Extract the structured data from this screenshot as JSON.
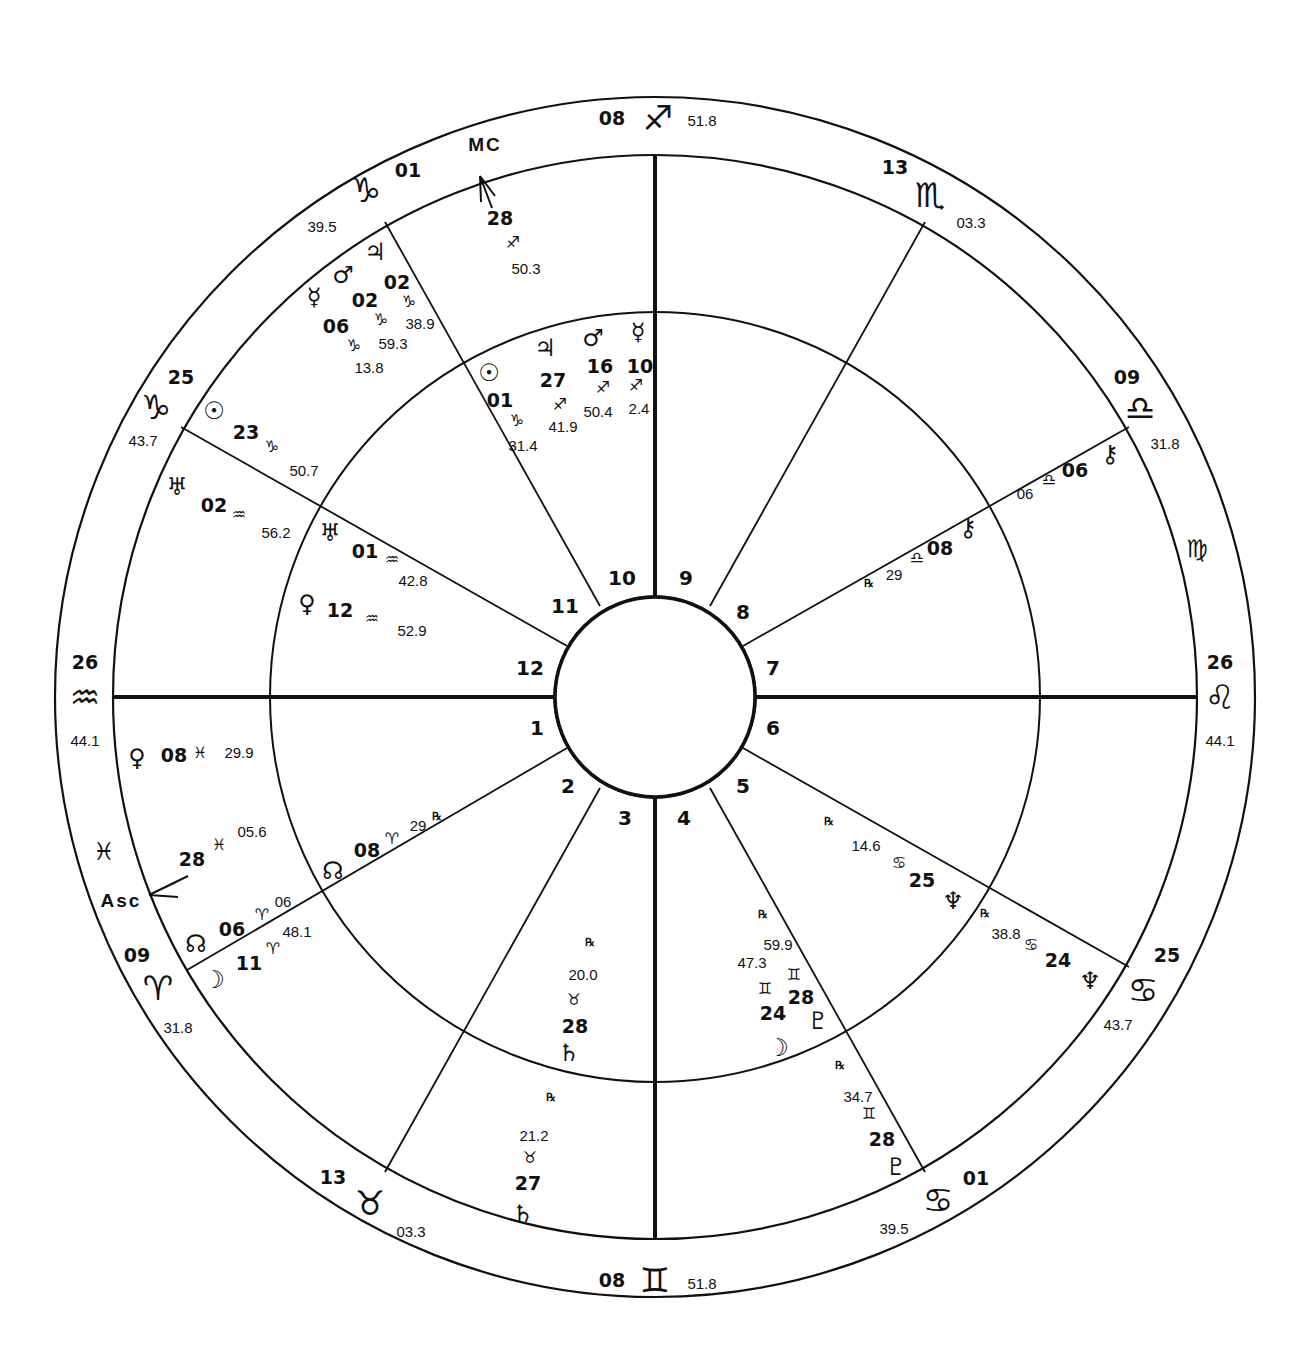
{
  "chart": {
    "type": "bi-wheel natal chart",
    "center": [
      655,
      697
    ],
    "radii": {
      "outer": 600,
      "zodiac_inner": 542,
      "middle": 385,
      "hub": 100
    },
    "line_color": "#111111",
    "background": "#ffffff"
  },
  "cusp_lines": [
    {
      "house": 10,
      "x1": 655,
      "y1": 597,
      "x2": 655,
      "y2": 155,
      "heavy": true
    },
    {
      "house": 4,
      "x1": 655,
      "y1": 797,
      "x2": 655,
      "y2": 1239,
      "heavy": true
    },
    {
      "house": 1,
      "x1": 555,
      "y1": 697,
      "x2": 113,
      "y2": 697,
      "heavy": true
    },
    {
      "house": 7,
      "x1": 755,
      "y1": 697,
      "x2": 1197,
      "y2": 697,
      "heavy": true
    },
    {
      "house": 11,
      "x1": 600,
      "y1": 606,
      "x2": 385,
      "y2": 222,
      "heavy": false
    },
    {
      "house": 12,
      "x1": 567,
      "y1": 646,
      "x2": 181,
      "y2": 427,
      "heavy": false
    },
    {
      "house": 2,
      "x1": 567,
      "y1": 748,
      "x2": 187,
      "y2": 970,
      "heavy": false
    },
    {
      "house": 3,
      "x1": 600,
      "y1": 788,
      "x2": 385,
      "y2": 1172,
      "heavy": false
    },
    {
      "house": 5,
      "x1": 710,
      "y1": 788,
      "x2": 925,
      "y2": 1172,
      "heavy": false
    },
    {
      "house": 6,
      "x1": 743,
      "y1": 748,
      "x2": 1129,
      "y2": 967,
      "heavy": false
    },
    {
      "house": 8,
      "x1": 743,
      "y1": 646,
      "x2": 1129,
      "y2": 427,
      "heavy": false
    },
    {
      "house": 9,
      "x1": 710,
      "y1": 606,
      "x2": 925,
      "y2": 222,
      "heavy": false
    }
  ],
  "house_numbers": [
    {
      "n": "10",
      "x": 622,
      "y": 578
    },
    {
      "n": "9",
      "x": 686,
      "y": 578
    },
    {
      "n": "8",
      "x": 743,
      "y": 612
    },
    {
      "n": "7",
      "x": 773,
      "y": 668
    },
    {
      "n": "6",
      "x": 773,
      "y": 728
    },
    {
      "n": "5",
      "x": 743,
      "y": 786
    },
    {
      "n": "4",
      "x": 684,
      "y": 818
    },
    {
      "n": "3",
      "x": 625,
      "y": 818
    },
    {
      "n": "2",
      "x": 568,
      "y": 786
    },
    {
      "n": "1",
      "x": 537,
      "y": 728
    },
    {
      "n": "12",
      "x": 530,
      "y": 668
    },
    {
      "n": "11",
      "x": 565,
      "y": 606
    }
  ],
  "cusp_signs": [
    {
      "id": "mc",
      "deg": "08",
      "sign": "♐",
      "sign_name": "sagittarius",
      "min": "51.8",
      "deg_pos": [
        612,
        118
      ],
      "sign_pos": [
        658,
        118
      ],
      "min_pos": [
        702,
        120
      ]
    },
    {
      "id": "c11",
      "deg": "01",
      "sign": "♑",
      "sign_name": "capricorn",
      "min": "39.5",
      "deg_pos": [
        408,
        170
      ],
      "sign_pos": [
        366,
        190
      ],
      "min_pos": [
        322,
        226
      ]
    },
    {
      "id": "c12",
      "deg": "25",
      "sign": "♑",
      "sign_name": "capricorn",
      "min": "43.7",
      "deg_pos": [
        181,
        377
      ],
      "sign_pos": [
        156,
        407
      ],
      "min_pos": [
        143,
        440
      ]
    },
    {
      "id": "asc",
      "deg": "26",
      "sign": "♒",
      "sign_name": "aquarius",
      "min": "44.1",
      "deg_pos": [
        85,
        662
      ],
      "sign_pos": [
        85,
        697
      ],
      "min_pos": [
        85,
        740
      ]
    },
    {
      "id": "c2",
      "deg": "09",
      "sign": "♈",
      "sign_name": "aries",
      "min": "31.8",
      "deg_pos": [
        137,
        955
      ],
      "sign_pos": [
        158,
        988
      ],
      "min_pos": [
        178,
        1027
      ]
    },
    {
      "id": "c3",
      "deg": "13",
      "sign": "♉",
      "sign_name": "taurus",
      "min": "03.3",
      "deg_pos": [
        333,
        1177
      ],
      "sign_pos": [
        370,
        1203
      ],
      "min_pos": [
        411,
        1231
      ]
    },
    {
      "id": "ic",
      "deg": "08",
      "sign": "♊",
      "sign_name": "gemini",
      "min": "51.8",
      "deg_pos": [
        612,
        1280
      ],
      "sign_pos": [
        655,
        1280
      ],
      "min_pos": [
        702,
        1283
      ]
    },
    {
      "id": "c5",
      "deg": "01",
      "sign": "♋",
      "sign_name": "cancer",
      "min": "39.5",
      "deg_pos": [
        976,
        1178
      ],
      "sign_pos": [
        938,
        1200
      ],
      "min_pos": [
        894,
        1228
      ]
    },
    {
      "id": "c6",
      "deg": "25",
      "sign": "♋",
      "sign_name": "cancer",
      "min": "43.7",
      "deg_pos": [
        1167,
        955
      ],
      "sign_pos": [
        1143,
        990
      ],
      "min_pos": [
        1118,
        1024
      ]
    },
    {
      "id": "dsc",
      "deg": "26",
      "sign": "♌",
      "sign_name": "leo",
      "min": "44.1",
      "deg_pos": [
        1220,
        662
      ],
      "sign_pos": [
        1220,
        697
      ],
      "min_pos": [
        1220,
        740
      ]
    },
    {
      "id": "c8",
      "deg": "09",
      "sign": "♎",
      "sign_name": "libra",
      "min": "31.8",
      "deg_pos": [
        1127,
        377
      ],
      "sign_pos": [
        1140,
        408
      ],
      "min_pos": [
        1165,
        443
      ]
    },
    {
      "id": "c9",
      "deg": "13",
      "sign": "♏",
      "sign_name": "scorpio",
      "min": "03.3",
      "deg_pos": [
        895,
        167
      ],
      "sign_pos": [
        930,
        195
      ],
      "min_pos": [
        971,
        222
      ]
    }
  ],
  "intercepted_signs": [
    {
      "sign": "♓",
      "sign_name": "pisces",
      "x": 104,
      "y": 852
    },
    {
      "sign": "♍",
      "sign_name": "virgo",
      "x": 1197,
      "y": 549
    }
  ],
  "angle_labels": [
    {
      "text": "MC",
      "x": 485,
      "y": 144
    },
    {
      "text": "Asc",
      "x": 121,
      "y": 900
    }
  ],
  "angle_arrows": [
    {
      "id": "mc-arrow",
      "path": "M480 176 L492 208 M480 176 L481 202 M480 176 L495 196"
    },
    {
      "id": "asc-arrow",
      "path": "M149 895 L188 876 M149 895 L178 897 M149 895 L176 882"
    }
  ],
  "inner_planets": [
    {
      "name": "sun",
      "glyph": "☉",
      "deg": "01",
      "sign": "♑",
      "min": "31.4",
      "glyph_pos": [
        489,
        373
      ],
      "deg_pos": [
        500,
        400
      ],
      "sign_pos": [
        517,
        421
      ],
      "min_pos": [
        523,
        445
      ]
    },
    {
      "name": "jupiter",
      "glyph": "♃",
      "deg": "27",
      "sign": "♐",
      "min": "41.9",
      "glyph_pos": [
        545,
        348
      ],
      "deg_pos": [
        553,
        380
      ],
      "sign_pos": [
        560,
        405
      ],
      "min_pos": [
        563,
        426
      ]
    },
    {
      "name": "mars",
      "glyph": "♂",
      "deg": "16",
      "sign": "♐",
      "min": "50.4",
      "glyph_pos": [
        593,
        338
      ],
      "deg_pos": [
        600,
        366
      ],
      "sign_pos": [
        603,
        388
      ],
      "min_pos": [
        598,
        411
      ]
    },
    {
      "name": "mercury",
      "glyph": "☿",
      "deg": "10",
      "sign": "♐",
      "min": "2.4",
      "glyph_pos": [
        638,
        332
      ],
      "deg_pos": [
        640,
        366
      ],
      "sign_pos": [
        636,
        386
      ],
      "min_pos": [
        639,
        408
      ]
    },
    {
      "name": "uranus",
      "glyph": "♅",
      "deg": "01",
      "sign": "♒",
      "min": "42.8",
      "glyph_pos": [
        330,
        533
      ],
      "deg_pos": [
        365,
        551
      ],
      "sign_pos": [
        392,
        560
      ],
      "min_pos": [
        413,
        580
      ]
    },
    {
      "name": "venus",
      "glyph": "♀",
      "deg": "12",
      "sign": "♒",
      "min": "52.9",
      "glyph_pos": [
        307,
        604
      ],
      "deg_pos": [
        340,
        610
      ],
      "sign_pos": [
        372,
        619
      ],
      "min_pos": [
        412,
        630
      ]
    },
    {
      "name": "north-node",
      "glyph": "☊",
      "deg": "08",
      "sign": "♈",
      "min": "29",
      "rx": "℞",
      "glyph_pos": [
        333,
        871
      ],
      "deg_pos": [
        367,
        850
      ],
      "sign_pos": [
        392,
        839
      ],
      "min_pos": [
        418,
        825
      ],
      "rx_pos": [
        437,
        816
      ]
    },
    {
      "name": "saturn",
      "glyph": "♄",
      "deg": "28",
      "sign": "♉",
      "min": "20.0",
      "rx": "℞",
      "glyph_pos": [
        569,
        1053
      ],
      "deg_pos": [
        575,
        1026
      ],
      "sign_pos": [
        574,
        1000
      ],
      "min_pos": [
        583,
        974
      ],
      "rx_pos": [
        590,
        942
      ]
    },
    {
      "name": "moon",
      "glyph": "☽",
      "deg": "24",
      "sign": "♊",
      "min": "47.3",
      "glyph_pos": [
        778,
        1048
      ],
      "deg_pos": [
        773,
        1013
      ],
      "sign_pos": [
        765,
        989
      ],
      "min_pos": [
        752,
        962
      ]
    },
    {
      "name": "pluto",
      "glyph": "♇",
      "deg": "28",
      "sign": "♊",
      "min": "59.9",
      "rx": "℞",
      "glyph_pos": [
        818,
        1021
      ],
      "deg_pos": [
        801,
        997
      ],
      "sign_pos": [
        794,
        975
      ],
      "min_pos": [
        778,
        944
      ],
      "rx_pos": [
        763,
        914
      ]
    },
    {
      "name": "neptune",
      "glyph": "♆",
      "deg": "25",
      "sign": "♋",
      "min": "14.6",
      "rx": "℞",
      "glyph_pos": [
        953,
        901
      ],
      "deg_pos": [
        922,
        880
      ],
      "sign_pos": [
        899,
        863
      ],
      "min_pos": [
        866,
        845
      ],
      "rx_pos": [
        829,
        821
      ]
    },
    {
      "name": "chiron",
      "glyph": "⚷",
      "deg": "08",
      "sign": "♎",
      "min": "29",
      "rx": "℞",
      "glyph_pos": [
        968,
        528
      ],
      "deg_pos": [
        940,
        548
      ],
      "sign_pos": [
        917,
        558
      ],
      "min_pos": [
        894,
        574
      ],
      "rx_pos": [
        869,
        583
      ]
    }
  ],
  "outer_planets": [
    {
      "name": "mc-point",
      "glyph": "",
      "deg": "28",
      "sign": "♐",
      "min": "50.3",
      "deg_pos": [
        500,
        218
      ],
      "sign_pos": [
        513,
        243
      ],
      "min_pos": [
        526,
        268
      ]
    },
    {
      "name": "jupiter",
      "glyph": "♃",
      "deg": "02",
      "sign": "♑",
      "min": "38.9",
      "glyph_pos": [
        375,
        252
      ],
      "deg_pos": [
        397,
        282
      ],
      "sign_pos": [
        409,
        302
      ],
      "min_pos": [
        420,
        323
      ]
    },
    {
      "name": "mars",
      "glyph": "♂",
      "deg": "02",
      "sign": "♑",
      "min": "59.3",
      "glyph_pos": [
        343,
        275
      ],
      "deg_pos": [
        365,
        300
      ],
      "sign_pos": [
        381,
        320
      ],
      "min_pos": [
        393,
        343
      ]
    },
    {
      "name": "mercury",
      "glyph": "☿",
      "deg": "06",
      "sign": "♑",
      "min": "13.8",
      "glyph_pos": [
        314,
        297
      ],
      "deg_pos": [
        336,
        326
      ],
      "sign_pos": [
        354,
        346
      ],
      "min_pos": [
        369,
        367
      ]
    },
    {
      "name": "sun",
      "glyph": "☉",
      "deg": "23",
      "sign": "♑",
      "min": "50.7",
      "glyph_pos": [
        214,
        411
      ],
      "deg_pos": [
        246,
        432
      ],
      "sign_pos": [
        272,
        447
      ],
      "min_pos": [
        304,
        470
      ]
    },
    {
      "name": "uranus",
      "glyph": "♅",
      "deg": "02",
      "sign": "♒",
      "min": "56.2",
      "glyph_pos": [
        177,
        487
      ],
      "deg_pos": [
        214,
        505
      ],
      "sign_pos": [
        239,
        515
      ],
      "min_pos": [
        276,
        532
      ]
    },
    {
      "name": "venus",
      "glyph": "♀",
      "deg": "08",
      "sign": "♓",
      "min": "29.9",
      "glyph_pos": [
        137,
        758
      ],
      "deg_pos": [
        174,
        755
      ],
      "sign_pos": [
        200,
        753
      ],
      "min_pos": [
        239,
        752
      ]
    },
    {
      "name": "asc-point",
      "glyph": "",
      "deg": "28",
      "sign": "♓",
      "min": "05.6",
      "deg_pos": [
        192,
        859
      ],
      "sign_pos": [
        219,
        845
      ],
      "min_pos": [
        252,
        831
      ]
    },
    {
      "name": "north-node",
      "glyph": "☊",
      "deg": "06",
      "sign": "♈",
      "min": "06",
      "glyph_pos": [
        196,
        944
      ],
      "deg_pos": [
        232,
        929
      ],
      "sign_pos": [
        262,
        915
      ],
      "min_pos": [
        283,
        901
      ]
    },
    {
      "name": "moon",
      "glyph": "☽",
      "deg": "11",
      "sign": "♈",
      "min": "48.1",
      "glyph_pos": [
        214,
        980
      ],
      "deg_pos": [
        249,
        963
      ],
      "sign_pos": [
        273,
        949
      ],
      "min_pos": [
        297,
        931
      ]
    },
    {
      "name": "saturn",
      "glyph": "♄",
      "deg": "27",
      "sign": "♉",
      "min": "21.2",
      "rx": "℞",
      "glyph_pos": [
        523,
        1214
      ],
      "deg_pos": [
        528,
        1183
      ],
      "sign_pos": [
        530,
        1158
      ],
      "min_pos": [
        534,
        1135
      ],
      "rx_pos": [
        551,
        1097
      ]
    },
    {
      "name": "pluto",
      "glyph": "♇",
      "deg": "28",
      "sign": "♊",
      "min": "34.7",
      "rx": "℞",
      "glyph_pos": [
        896,
        1167
      ],
      "deg_pos": [
        882,
        1139
      ],
      "sign_pos": [
        869,
        1114
      ],
      "min_pos": [
        858,
        1096
      ],
      "rx_pos": [
        840,
        1065
      ]
    },
    {
      "name": "neptune",
      "glyph": "♆",
      "deg": "24",
      "sign": "♋",
      "min": "38.8",
      "rx": "℞",
      "glyph_pos": [
        1090,
        981
      ],
      "deg_pos": [
        1058,
        960
      ],
      "sign_pos": [
        1031,
        945
      ],
      "min_pos": [
        1006,
        933
      ],
      "rx_pos": [
        985,
        913
      ]
    },
    {
      "name": "chiron",
      "glyph": "⚷",
      "deg": "06",
      "sign": "♎",
      "min": "06",
      "glyph_pos": [
        1110,
        454
      ],
      "deg_pos": [
        1075,
        470
      ],
      "sign_pos": [
        1049,
        480
      ],
      "min_pos": [
        1025,
        493
      ]
    }
  ]
}
